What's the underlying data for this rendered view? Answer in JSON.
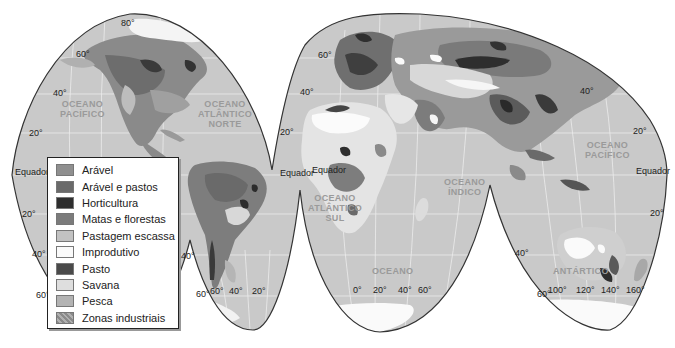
{
  "map": {
    "projection": "interrupted homolosine",
    "colors": {
      "ocean": "#c9c9c9",
      "land_base": "#d4d4d4",
      "ice": "#ffffff",
      "outline": "#333333",
      "grid": "#eeeeee"
    },
    "oceans": [
      {
        "id": "pacifico-norte",
        "text": "OCEANO\nPACÍFICO"
      },
      {
        "id": "atlantico-norte",
        "text": "OCEANO\nATLÂNTICO\nNORTE"
      },
      {
        "id": "pacifico-oeste",
        "text": "OCEANO\nPACÍFICO"
      },
      {
        "id": "atlantico-sul",
        "text": "OCEANO\nATLÂNTICO\nSUL"
      },
      {
        "id": "indico",
        "text": "OCEANO\nÍNDICO"
      },
      {
        "id": "oceano-sul",
        "text": "OCEANO"
      },
      {
        "id": "antartico",
        "text": "ANTÁRTICO"
      }
    ],
    "latitude_labels": {
      "equador_left": "Equador",
      "equador_mid": "Equador",
      "equador_mid2": "Equador",
      "equador_right": "Equador",
      "n80": "80°",
      "n60_left": "60°",
      "n40_left": "40°",
      "n20_left": "20°",
      "n60_mid": "60°",
      "n40_mid": "40°",
      "n20_mid": "20°",
      "n40_right": "40°",
      "n20_right": "20°",
      "s20_left": "20°",
      "s40_left": "40°",
      "s60_left": "60°",
      "s40_sa": "40°",
      "s60_sa": "60°",
      "s40_au": "40°",
      "s60_au": "60°",
      "s20_right": "20°"
    },
    "longitude_labels": {
      "sa": [
        "60°",
        "40°",
        "20°"
      ],
      "africa": [
        "0°",
        "20°",
        "40°",
        "60°"
      ],
      "australia": [
        "100°",
        "120°",
        "140°",
        "160°"
      ]
    }
  },
  "legend": {
    "items": [
      {
        "label": "Arável",
        "color": "#8f8f8f"
      },
      {
        "label": "Arável e pastos",
        "color": "#6a6a6a"
      },
      {
        "label": "Horticultura",
        "color": "#2e2e2e"
      },
      {
        "label": "Matas e florestas",
        "color": "#7b7b7b"
      },
      {
        "label": "Pastagem escassa",
        "color": "#c2c2c2"
      },
      {
        "label": "Improdutivo",
        "color": "#fafafa"
      },
      {
        "label": "Pasto",
        "color": "#4a4a4a"
      },
      {
        "label": "Savana",
        "color": "#dedede"
      },
      {
        "label": "Pesca",
        "color": "#b3b3b3"
      },
      {
        "label": "Zonas industriais",
        "color": "#9a9a9a",
        "pattern": "hatch"
      }
    ]
  }
}
